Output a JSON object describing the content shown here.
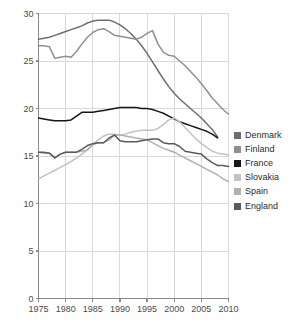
{
  "chart_data": {
    "type": "line",
    "title": "",
    "xlabel": "",
    "ylabel": "",
    "xlim": [
      1975,
      2010
    ],
    "ylim": [
      0,
      30
    ],
    "grid": true,
    "legend_position": "right",
    "xticks": [
      1975,
      1980,
      1985,
      1990,
      1995,
      2000,
      2005,
      2010
    ],
    "yticks": [
      0,
      5,
      10,
      15,
      20,
      25,
      30
    ],
    "series": [
      {
        "name": "Denmark",
        "color": "#6e6e6e",
        "x": [
          1975,
          1976,
          1977,
          1978,
          1979,
          1980,
          1981,
          1982,
          1983,
          1984,
          1985,
          1986,
          1987,
          1988,
          1989,
          1990,
          1991,
          1992,
          1993,
          1994,
          1995,
          1996,
          1997,
          1998,
          1999,
          2000,
          2001,
          2002,
          2003,
          2004,
          2005,
          2006,
          2007,
          2008
        ],
        "y": [
          27.3,
          27.4,
          27.5,
          27.7,
          27.9,
          28.1,
          28.3,
          28.5,
          28.7,
          29.0,
          29.2,
          29.3,
          29.3,
          29.3,
          29.1,
          28.8,
          28.4,
          27.9,
          27.3,
          26.6,
          25.8,
          24.9,
          24.0,
          23.1,
          22.3,
          21.6,
          21.0,
          20.5,
          20.0,
          19.5,
          19.0,
          18.4,
          17.8,
          17.0
        ]
      },
      {
        "name": "Finland",
        "color": "#8f8f8f",
        "x": [
          1975,
          1976,
          1977,
          1978,
          1979,
          1980,
          1981,
          1982,
          1983,
          1984,
          1985,
          1986,
          1987,
          1988,
          1989,
          1990,
          1991,
          1992,
          1993,
          1994,
          1995,
          1996,
          1997,
          1998,
          1999,
          2000,
          2001,
          2002,
          2003,
          2004,
          2005,
          2006,
          2007,
          2008,
          2009,
          2010
        ],
        "y": [
          26.6,
          26.6,
          26.5,
          25.3,
          25.4,
          25.5,
          25.4,
          26.0,
          26.8,
          27.5,
          28.0,
          28.3,
          28.4,
          28.1,
          27.7,
          27.6,
          27.5,
          27.4,
          27.3,
          27.5,
          27.9,
          28.2,
          26.8,
          25.9,
          25.6,
          25.5,
          25.0,
          24.5,
          23.9,
          23.3,
          22.6,
          21.9,
          21.1,
          20.5,
          19.9,
          19.4
        ]
      },
      {
        "name": "France",
        "color": "#161616",
        "x": [
          1975,
          1976,
          1977,
          1978,
          1979,
          1980,
          1981,
          1982,
          1983,
          1984,
          1985,
          1986,
          1987,
          1988,
          1989,
          1990,
          1991,
          1992,
          1993,
          1994,
          1995,
          1996,
          1997,
          1998,
          1999,
          2000,
          2001,
          2002,
          2003,
          2004,
          2005,
          2006,
          2007,
          2008
        ],
        "y": [
          19.0,
          18.9,
          18.8,
          18.7,
          18.7,
          18.7,
          18.8,
          19.2,
          19.6,
          19.6,
          19.6,
          19.7,
          19.8,
          19.9,
          20.0,
          20.1,
          20.1,
          20.1,
          20.1,
          20.0,
          20.0,
          19.9,
          19.7,
          19.5,
          19.2,
          18.9,
          18.6,
          18.4,
          18.2,
          18.0,
          17.8,
          17.6,
          17.3,
          16.9
        ]
      },
      {
        "name": "Slovakia",
        "color": "#c2c2c2",
        "x": [
          1975,
          1976,
          1977,
          1978,
          1979,
          1980,
          1981,
          1982,
          1983,
          1984,
          1985,
          1986,
          1987,
          1988,
          1989,
          1990,
          1991,
          1992,
          1993,
          1994,
          1995,
          1996,
          1997,
          1998,
          1999,
          2000,
          2001,
          2002,
          2003,
          2004,
          2005,
          2006,
          2007,
          2008,
          2009,
          2010
        ],
        "y": [
          12.6,
          12.9,
          13.2,
          13.5,
          13.8,
          14.1,
          14.4,
          14.8,
          15.2,
          15.7,
          16.2,
          16.7,
          17.1,
          17.3,
          17.3,
          17.2,
          17.3,
          17.5,
          17.6,
          17.7,
          17.7,
          17.7,
          17.9,
          18.3,
          18.8,
          19.0,
          18.6,
          18.0,
          17.4,
          16.8,
          16.3,
          15.9,
          15.5,
          15.3,
          15.2,
          15.1
        ]
      },
      {
        "name": "Spain",
        "color": "#b0b0b0",
        "x": [
          1975,
          1976,
          1977,
          1978,
          1979,
          1980,
          1981,
          1982,
          1983,
          1984,
          1985,
          1986,
          1987,
          1988,
          1989,
          1990,
          1991,
          1992,
          1993,
          1994,
          1995,
          1996,
          1997,
          1998,
          1999,
          2000,
          2001,
          2002,
          2003,
          2004,
          2005,
          2006,
          2007,
          2008,
          2009,
          2010
        ],
        "y": [
          15.4,
          15.3,
          15.3,
          14.8,
          15.2,
          15.4,
          15.4,
          15.4,
          15.5,
          15.6,
          16.2,
          16.4,
          16.4,
          16.7,
          17.2,
          17.2,
          17.1,
          17.0,
          16.9,
          16.8,
          16.7,
          16.4,
          16.1,
          15.8,
          15.6,
          15.4,
          15.1,
          14.8,
          14.5,
          14.2,
          13.9,
          13.6,
          13.3,
          13.0,
          12.6,
          12.3
        ]
      },
      {
        "name": "England",
        "color": "#5a5a5a",
        "x": [
          1975,
          1976,
          1977,
          1978,
          1979,
          1980,
          1981,
          1982,
          1983,
          1984,
          1985,
          1986,
          1987,
          1988,
          1989,
          1990,
          1991,
          1992,
          1993,
          1994,
          1995,
          1996,
          1997,
          1998,
          1999,
          2000,
          2001,
          2002,
          2003,
          2004,
          2005,
          2006,
          2007,
          2008,
          2009,
          2010
        ],
        "y": [
          15.4,
          15.4,
          15.3,
          14.8,
          15.2,
          15.4,
          15.4,
          15.4,
          15.7,
          16.1,
          16.3,
          16.4,
          16.4,
          16.9,
          17.2,
          16.6,
          16.5,
          16.5,
          16.5,
          16.6,
          16.7,
          16.8,
          16.8,
          16.4,
          16.3,
          16.3,
          16.0,
          15.5,
          15.4,
          15.3,
          15.2,
          14.7,
          14.3,
          14.0,
          14.0,
          13.9
        ]
      }
    ]
  },
  "axes": {
    "x_tick_labels": [
      "1975",
      "1980",
      "1985",
      "1990",
      "1995",
      "2000",
      "2005",
      "2010"
    ],
    "y_tick_labels": [
      "0",
      "5",
      "10",
      "15",
      "20",
      "25",
      "30"
    ]
  },
  "legend": {
    "items": [
      {
        "label": "Denmark",
        "color": "#6e6e6e"
      },
      {
        "label": "Finland",
        "color": "#8f8f8f"
      },
      {
        "label": "France",
        "color": "#161616"
      },
      {
        "label": "Slovakia",
        "color": "#c2c2c2"
      },
      {
        "label": "Spain",
        "color": "#b0b0b0"
      },
      {
        "label": "England",
        "color": "#5a5a5a"
      }
    ]
  },
  "style": {
    "grid_color": "#d9d9d9",
    "axis_color": "#8a8a8a",
    "text_color": "#4a4a4a"
  }
}
